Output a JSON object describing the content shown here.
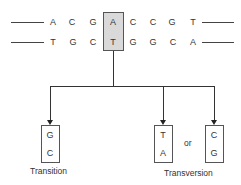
{
  "diagram": {
    "top_strand": [
      "A",
      "C",
      "G",
      "A",
      "C",
      "C",
      "G",
      "T"
    ],
    "bottom_strand": [
      "T",
      "G",
      "C",
      "T",
      "G",
      "G",
      "C",
      "A"
    ],
    "highlighted_index": 3,
    "highlight_color": "#d9d9d9",
    "outcomes": {
      "transition": {
        "top": "G",
        "bottom": "C",
        "label": "Transition"
      },
      "transversion_1": {
        "top": "T",
        "bottom": "A"
      },
      "transversion_2": {
        "top": "C",
        "bottom": "G"
      },
      "or_label": "or",
      "transversion_label": "Transversion"
    }
  }
}
